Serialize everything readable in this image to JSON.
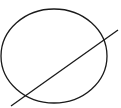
{
  "diagram": {
    "background": "#ffffff",
    "stroke_color": "#1a1a1a",
    "shapes": [
      {
        "type": "ellipse",
        "name": "circle",
        "cx": 54,
        "cy": 56,
        "rx": 53,
        "ry": 47
      },
      {
        "type": "line",
        "name": "secant-line",
        "x1": 11,
        "y1": 106,
        "x2": 118,
        "y2": 30
      }
    ]
  }
}
